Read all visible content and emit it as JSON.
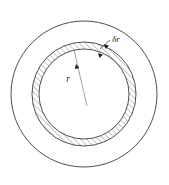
{
  "figure": {
    "background_color": "#ffffff",
    "stroke_color": "#3c3c3c",
    "hatch_color": "#6e6e6e",
    "label_color": "#1a1a1a",
    "labels": {
      "radius": "r",
      "thickness": "δr"
    },
    "geometry": {
      "center_x": 84,
      "center_y": 94,
      "outer_circle_radius": 73,
      "shell_outer_radius": 52,
      "shell_inner_radius": 45,
      "radius_line": {
        "from_x": 87,
        "from_y": 106,
        "to_x": 74,
        "to_y": 50
      },
      "radius_label_x": 68,
      "radius_label_y": 82,
      "thickness_label_x": 112,
      "thickness_label_y": 42,
      "leader_line": {
        "from_x": 110,
        "from_y": 40,
        "to_x": 100,
        "to_y": 49
      },
      "arrow_outer": {
        "x": 104,
        "y": 44
      },
      "arrow_inner": {
        "x": 98,
        "y": 53
      }
    }
  }
}
